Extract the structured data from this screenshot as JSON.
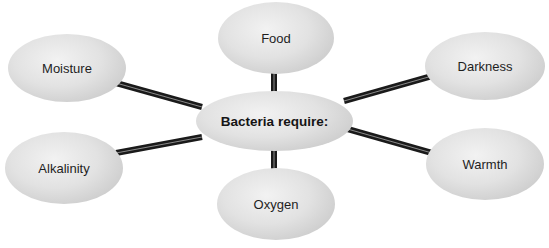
{
  "diagram": {
    "type": "hub-and-spoke",
    "center": {
      "label": "Bacteria require:"
    },
    "nodes": [
      {
        "id": "food",
        "label": "Food"
      },
      {
        "id": "moisture",
        "label": "Moisture"
      },
      {
        "id": "darkness",
        "label": "Darkness"
      },
      {
        "id": "alkalinity",
        "label": "Alkalinity"
      },
      {
        "id": "warmth",
        "label": "Warmth"
      },
      {
        "id": "oxygen",
        "label": "Oxygen"
      }
    ],
    "colors": {
      "node_fill": "#e2e2e2",
      "connector": "#1a1a1a",
      "text": "#1e1e1e",
      "background": "#ffffff"
    }
  }
}
